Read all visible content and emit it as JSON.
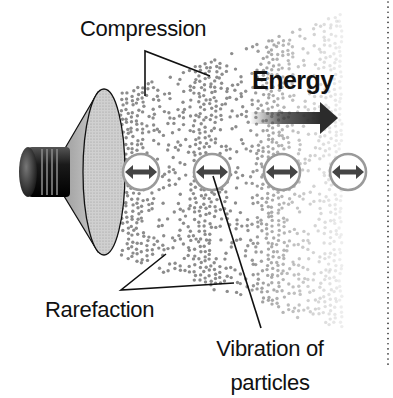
{
  "diagram": {
    "labels": {
      "compression": "Compression",
      "energy": "Energy",
      "rarefaction": "Rarefaction",
      "vibration_line1": "Vibration of",
      "vibration_line2": "particles"
    },
    "elements": {
      "source": "loudspeaker",
      "medium": "particle-field",
      "particle_markers": [
        {
          "x": 141,
          "y": 172,
          "icon": "double-arrow-icon"
        },
        {
          "x": 212,
          "y": 172,
          "icon": "double-arrow-icon"
        },
        {
          "x": 282,
          "y": 172,
          "icon": "double-arrow-icon"
        },
        {
          "x": 348,
          "y": 172,
          "icon": "double-arrow-icon"
        }
      ],
      "energy_arrow": {
        "from_x": 250,
        "to_x": 338,
        "y": 118,
        "color": "#2b2b2b"
      },
      "divider": "dotted-vertical-line"
    },
    "colors": {
      "dot": "#8c8c8c",
      "circle_ring": "#9a9a9a",
      "arrow": "#444444",
      "text": "#111111",
      "cone_fill": "#c9c9c9"
    }
  }
}
